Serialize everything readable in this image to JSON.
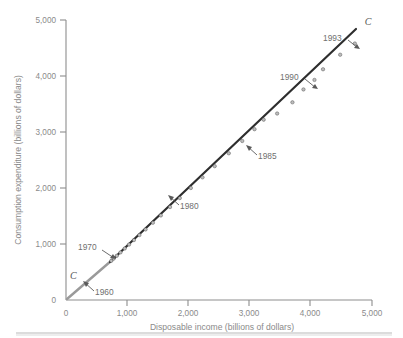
{
  "chart_data": {
    "type": "scatter",
    "title": "",
    "xlabel": "Disposable income (billions of dollars)",
    "ylabel": "Consumption expenditure (billions of dollars)",
    "xlim": [
      0,
      5000
    ],
    "ylim": [
      0,
      5000
    ],
    "grid": false,
    "legend": "none",
    "x_ticks": [
      "0",
      "1,000",
      "2,000",
      "3,000",
      "4,000",
      "5,000"
    ],
    "x_tick_values": [
      0,
      1000,
      2000,
      3000,
      4000,
      5000
    ],
    "y_ticks": [
      "0",
      "1,000",
      "2,000",
      "3,000",
      "4,000",
      "5,000"
    ],
    "y_tick_values": [
      0,
      1000,
      2000,
      3000,
      4000,
      5000
    ],
    "series": [
      {
        "name": "C",
        "point_labels": [
          "1960",
          "1961",
          "1962",
          "1963",
          "1964",
          "1965",
          "1966",
          "1967",
          "1968",
          "1969",
          "1970",
          "1971",
          "1972",
          "1973",
          "1974",
          "1975",
          "1976",
          "1977",
          "1978",
          "1979",
          "1980",
          "1981",
          "1982",
          "1983",
          "1984",
          "1985",
          "1986",
          "1987",
          "1988",
          "1989",
          "1990",
          "1991",
          "1992",
          "1993"
        ],
        "x": [
          740,
          770,
          810,
          850,
          910,
          975,
          1040,
          1100,
          1190,
          1270,
          1360,
          1480,
          1600,
          1800,
          1950,
          2100,
          2300,
          2550,
          2870,
          3200,
          3500,
          3900,
          4100,
          4400,
          4900,
          5200,
          5500,
          5800,
          6200,
          6600,
          7000,
          7200,
          7600,
          7900
        ],
        "y": [
          665,
          695,
          730,
          770,
          820,
          890,
          960,
          1010,
          1100,
          1180,
          1260,
          1360,
          1490,
          1640,
          1790,
          1970,
          2190,
          2430,
          2730,
          3030,
          3350,
          3700,
          3960,
          4270,
          4680,
          5000,
          5340,
          5680,
          6060,
          6470,
          6880,
          7060,
          7440,
          7800
        ]
      }
    ],
    "plot_points_income": [
      740,
      780,
      830,
      890,
      960,
      1030,
      1110,
      1200,
      1300,
      1420,
      1550,
      1700,
      1860,
      2040,
      2230,
      2430,
      2660,
      2880,
      3080,
      3230,
      3450,
      3700,
      3880,
      4060,
      4200,
      4480,
      4720
    ],
    "plot_points_consumption": [
      700,
      740,
      790,
      850,
      920,
      990,
      1070,
      1160,
      1260,
      1380,
      1510,
      1660,
      1820,
      2000,
      2190,
      2390,
      2620,
      2840,
      3050,
      3220,
      3330,
      3530,
      3760,
      3930,
      4120,
      4380,
      4580
    ],
    "annotations": [
      {
        "label": "1960",
        "data_x": 520,
        "data_y": 470
      },
      {
        "label": "1970",
        "data_x": 740,
        "data_y": 700
      },
      {
        "label": "1980",
        "data_x": 1760,
        "data_y": 1720
      },
      {
        "label": "1985",
        "data_x": 2860,
        "data_y": 2810
      },
      {
        "label": "1990",
        "data_x": 3820,
        "data_y": 3720
      },
      {
        "label": "1993",
        "data_x": 4720,
        "data_y": 4580
      }
    ],
    "curve_labels": [
      {
        "label": "C",
        "position": "lower-left-origin"
      },
      {
        "label": "C",
        "position": "upper-right-end"
      }
    ]
  },
  "axes": {
    "y": {
      "title": "Consumption expenditure (billions of dollars)",
      "ticks": [
        {
          "label": "5,000"
        },
        {
          "label": "4,000"
        },
        {
          "label": "3,000"
        },
        {
          "label": "2,000"
        },
        {
          "label": "1,000"
        },
        {
          "label": "0"
        }
      ]
    },
    "x": {
      "title": "Disposable income (billions of dollars)",
      "ticks": [
        {
          "label": "0"
        },
        {
          "label": "1,000"
        },
        {
          "label": "2,000"
        },
        {
          "label": "3,000"
        },
        {
          "label": "4,000"
        },
        {
          "label": "5,000"
        }
      ]
    }
  },
  "annotation_labels": {
    "a1960": "1960",
    "a1970": "1970",
    "a1980": "1980",
    "a1985": "1985",
    "a1990": "1990",
    "a1993": "1993"
  },
  "curve": {
    "label_origin": "C",
    "label_end": "C"
  },
  "colors": {
    "axis": "#8d8d8d",
    "tick_text": "#8a8a8a",
    "line_main": "#2e2e2e",
    "line_early": "#9a9a9a",
    "point_fill": "#bdbdbd",
    "point_stroke": "#4a4a4a",
    "annotation_text": "#6f6f6f",
    "background": "#ffffff",
    "footer_rule": "#b9b9b9"
  }
}
